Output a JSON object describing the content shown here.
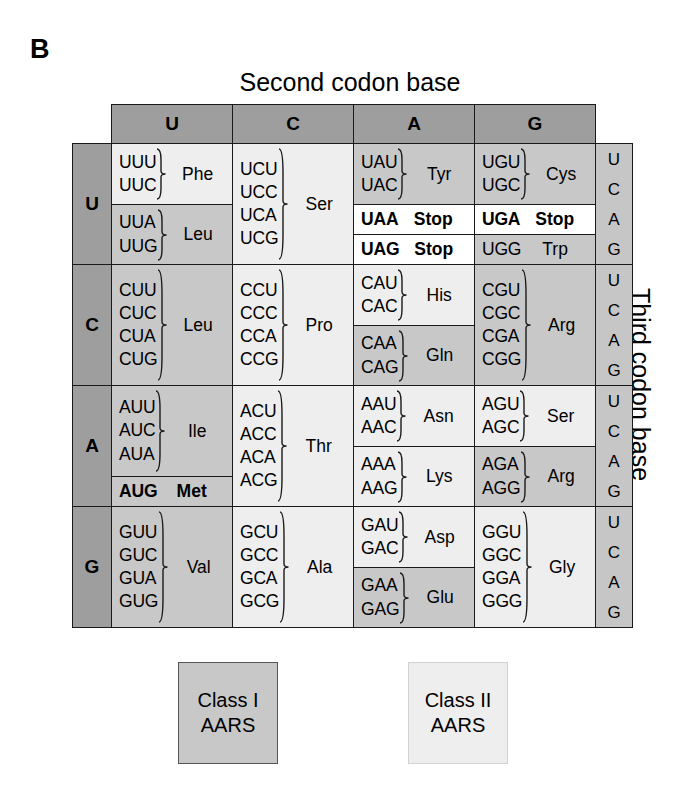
{
  "panel": {
    "label": "B"
  },
  "axes": {
    "second": "Second codon base",
    "first": "First codon base",
    "third": "Third codon base"
  },
  "column_headers": [
    "U",
    "C",
    "A",
    "G"
  ],
  "row_headers": [
    "U",
    "C",
    "A",
    "G"
  ],
  "third_base_letters": [
    "U",
    "C",
    "A",
    "G"
  ],
  "legend": {
    "class1": {
      "line1": "Class I",
      "line2": "AARS",
      "color": "#c8c8c8"
    },
    "class2": {
      "line1": "Class II",
      "line2": "AARS",
      "color": "#eeeeee"
    }
  },
  "colors": {
    "class1_shade": "#c8c8c8",
    "class2_shade": "#eeeeee",
    "stop_shade": "#ffffff",
    "header_shade": "#9e9e9e",
    "third_col_shade": "#c6c6c6",
    "border": "#1a1a1a"
  },
  "chart_data": {
    "type": "table",
    "xlabel": "Second codon base",
    "ylabel": "First codon base",
    "legend": [
      "Class I AARS",
      "Class II AARS"
    ],
    "blocks": [
      {
        "row": "U",
        "col": "U",
        "groups": [
          {
            "codons": [
              "UUU",
              "UUC"
            ],
            "aa": "Phe",
            "class": "II",
            "bold": false
          },
          {
            "codons": [
              "UUA",
              "UUG"
            ],
            "aa": "Leu",
            "class": "I",
            "bold": false
          }
        ]
      },
      {
        "row": "U",
        "col": "C",
        "groups": [
          {
            "codons": [
              "UCU",
              "UCC",
              "UCA",
              "UCG"
            ],
            "aa": "Ser",
            "class": "II",
            "bold": false
          }
        ]
      },
      {
        "row": "U",
        "col": "A",
        "groups": [
          {
            "codons": [
              "UAU",
              "UAC"
            ],
            "aa": "Tyr",
            "class": "I",
            "bold": false
          },
          {
            "codons": [
              "UAA"
            ],
            "aa": "Stop",
            "class": "none",
            "bold": true
          },
          {
            "codons": [
              "UAG"
            ],
            "aa": "Stop",
            "class": "none",
            "bold": true
          }
        ]
      },
      {
        "row": "U",
        "col": "G",
        "groups": [
          {
            "codons": [
              "UGU",
              "UGC"
            ],
            "aa": "Cys",
            "class": "I",
            "bold": false
          },
          {
            "codons": [
              "UGA"
            ],
            "aa": "Stop",
            "class": "none",
            "bold": true
          },
          {
            "codons": [
              "UGG"
            ],
            "aa": "Trp",
            "class": "I",
            "bold": false
          }
        ]
      },
      {
        "row": "C",
        "col": "U",
        "groups": [
          {
            "codons": [
              "CUU",
              "CUC",
              "CUA",
              "CUG"
            ],
            "aa": "Leu",
            "class": "I",
            "bold": false
          }
        ]
      },
      {
        "row": "C",
        "col": "C",
        "groups": [
          {
            "codons": [
              "CCU",
              "CCC",
              "CCA",
              "CCG"
            ],
            "aa": "Pro",
            "class": "II",
            "bold": false
          }
        ]
      },
      {
        "row": "C",
        "col": "A",
        "groups": [
          {
            "codons": [
              "CAU",
              "CAC"
            ],
            "aa": "His",
            "class": "II",
            "bold": false
          },
          {
            "codons": [
              "CAA",
              "CAG"
            ],
            "aa": "Gln",
            "class": "I",
            "bold": false
          }
        ]
      },
      {
        "row": "C",
        "col": "G",
        "groups": [
          {
            "codons": [
              "CGU",
              "CGC",
              "CGA",
              "CGG"
            ],
            "aa": "Arg",
            "class": "I",
            "bold": false
          }
        ]
      },
      {
        "row": "A",
        "col": "U",
        "groups": [
          {
            "codons": [
              "AUU",
              "AUC",
              "AUA"
            ],
            "aa": "Ile",
            "class": "I",
            "bold": false
          },
          {
            "codons": [
              "AUG"
            ],
            "aa": "Met",
            "class": "I",
            "bold": true
          }
        ]
      },
      {
        "row": "A",
        "col": "C",
        "groups": [
          {
            "codons": [
              "ACU",
              "ACC",
              "ACA",
              "ACG"
            ],
            "aa": "Thr",
            "class": "II",
            "bold": false
          }
        ]
      },
      {
        "row": "A",
        "col": "A",
        "groups": [
          {
            "codons": [
              "AAU",
              "AAC"
            ],
            "aa": "Asn",
            "class": "II",
            "bold": false
          },
          {
            "codons": [
              "AAA",
              "AAG"
            ],
            "aa": "Lys",
            "class": "II",
            "bold": false
          }
        ]
      },
      {
        "row": "A",
        "col": "G",
        "groups": [
          {
            "codons": [
              "AGU",
              "AGC"
            ],
            "aa": "Ser",
            "class": "II",
            "bold": false
          },
          {
            "codons": [
              "AGA",
              "AGG"
            ],
            "aa": "Arg",
            "class": "I",
            "bold": false
          }
        ]
      },
      {
        "row": "G",
        "col": "U",
        "groups": [
          {
            "codons": [
              "GUU",
              "GUC",
              "GUA",
              "GUG"
            ],
            "aa": "Val",
            "class": "I",
            "bold": false
          }
        ]
      },
      {
        "row": "G",
        "col": "C",
        "groups": [
          {
            "codons": [
              "GCU",
              "GCC",
              "GCA",
              "GCG"
            ],
            "aa": "Ala",
            "class": "II",
            "bold": false
          }
        ]
      },
      {
        "row": "G",
        "col": "A",
        "groups": [
          {
            "codons": [
              "GAU",
              "GAC"
            ],
            "aa": "Asp",
            "class": "II",
            "bold": false
          },
          {
            "codons": [
              "GAA",
              "GAG"
            ],
            "aa": "Glu",
            "class": "I",
            "bold": false
          }
        ]
      },
      {
        "row": "G",
        "col": "G",
        "groups": [
          {
            "codons": [
              "GGU",
              "GGC",
              "GGA",
              "GGG"
            ],
            "aa": "Gly",
            "class": "II",
            "bold": false
          }
        ]
      }
    ]
  }
}
